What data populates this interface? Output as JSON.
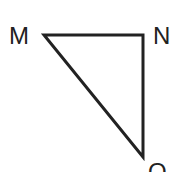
{
  "diagram": {
    "type": "triangle",
    "vertices": [
      {
        "label": "M",
        "x": 44,
        "y": 35
      },
      {
        "label": "N",
        "x": 143,
        "y": 35
      },
      {
        "label": "O",
        "x": 143,
        "y": 157
      }
    ],
    "edges": [
      [
        "M",
        "N"
      ],
      [
        "N",
        "O"
      ],
      [
        "O",
        "M"
      ]
    ],
    "stroke_color": "#222222"
  }
}
